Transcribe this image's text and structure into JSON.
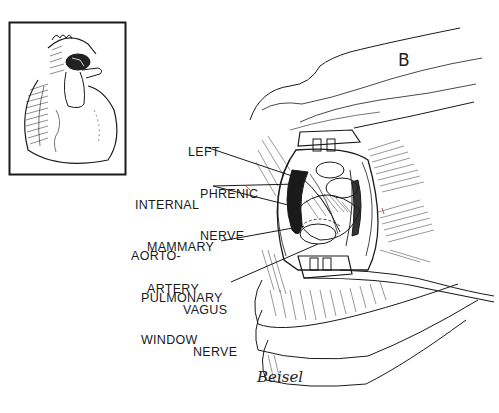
{
  "figure": {
    "panel_letter": "B",
    "signature": "Beisel",
    "inset": {
      "description": "anterior view of heart with highlighted aorto-pulmonary region"
    },
    "labels": [
      {
        "lines": [
          "LEFT",
          "PHRENIC",
          "NERVE"
        ]
      },
      {
        "lines": [
          "INTERNAL",
          "MAMMARY",
          "ARTERY"
        ]
      },
      {
        "lines": [
          "AORTO-",
          "PULMONARY",
          "WINDOW"
        ]
      },
      {
        "lines": [
          "VAGUS",
          "NERVE"
        ]
      }
    ]
  },
  "colors": {
    "ink": "#1a1a1a",
    "background": "#ffffff",
    "accent_red": "#b03030"
  }
}
